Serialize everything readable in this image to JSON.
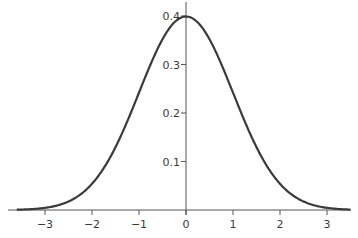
{
  "chart_data": {
    "type": "line",
    "title": "",
    "xlabel": "",
    "ylabel": "",
    "series": [
      {
        "name": "Standard normal density",
        "function": "exp(-x^2/2)/sqrt(2*pi)",
        "x_range": [
          -3.6,
          3.5
        ]
      }
    ],
    "x": [
      -3,
      -2,
      -1,
      0,
      1,
      2,
      3
    ],
    "values": [
      0.0044,
      0.054,
      0.242,
      0.399,
      0.242,
      0.054,
      0.0044
    ],
    "xticks": [
      "−3",
      "−2",
      "−1",
      "0",
      "1",
      "2",
      "3"
    ],
    "yticks": [
      "0.1",
      "0.2",
      "0.3",
      "0.4"
    ],
    "xlim": [
      -3.8,
      3.5
    ],
    "ylim": [
      0,
      0.4
    ],
    "grid": false,
    "legend": null
  },
  "style": {
    "curve_color": "#3a3a3a",
    "axis_color": "#555555"
  }
}
